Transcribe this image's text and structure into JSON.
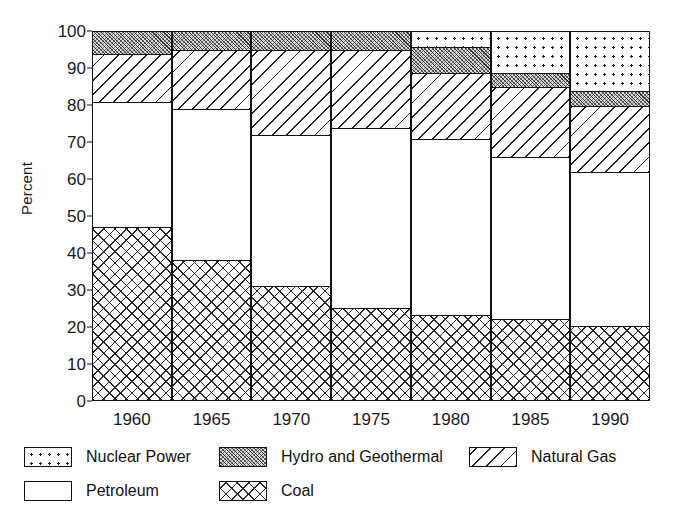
{
  "chart_data": {
    "type": "bar",
    "subtype": "stacked-bar",
    "title": "",
    "xlabel": "",
    "ylabel": "Percent",
    "ylim": [
      0,
      100
    ],
    "yticks": [
      0,
      10,
      20,
      30,
      40,
      50,
      60,
      70,
      80,
      90,
      100
    ],
    "grid": false,
    "legend_position": "below",
    "categories": [
      "1960",
      "1965",
      "1970",
      "1975",
      "1980",
      "1985",
      "1990"
    ],
    "series": [
      {
        "name": "Coal",
        "pattern": "crosshatch",
        "values": [
          47,
          38,
          31,
          25,
          23,
          22,
          20
        ]
      },
      {
        "name": "Petroleum",
        "pattern": "solid-white",
        "values": [
          34,
          41,
          41,
          49,
          48,
          44,
          42
        ]
      },
      {
        "name": "Natural Gas",
        "pattern": "diagonal-hatch",
        "values": [
          13,
          16,
          23,
          21,
          18,
          19,
          18
        ]
      },
      {
        "name": "Hydro and Geothermal",
        "pattern": "fine-stipple",
        "values": [
          6,
          5,
          5,
          5,
          7,
          4,
          4
        ]
      },
      {
        "name": "Nuclear Power",
        "pattern": "dotted",
        "values": [
          0,
          0,
          0,
          0,
          4,
          11,
          16
        ]
      }
    ],
    "stack_tops": {
      "1960": {
        "coal": 47,
        "petroleum": 81,
        "natural_gas": 94,
        "hydro": 100,
        "nuclear": 100
      },
      "1965": {
        "coal": 38,
        "petroleum": 79,
        "natural_gas": 95,
        "hydro": 100,
        "nuclear": 100
      },
      "1970": {
        "coal": 31,
        "petroleum": 72,
        "natural_gas": 95,
        "hydro": 100,
        "nuclear": 100
      },
      "1975": {
        "coal": 25,
        "petroleum": 74,
        "natural_gas": 95,
        "hydro": 100,
        "nuclear": 100
      },
      "1980": {
        "coal": 23,
        "petroleum": 71,
        "natural_gas": 89,
        "hydro": 96,
        "nuclear": 100
      },
      "1985": {
        "coal": 22,
        "petroleum": 66,
        "natural_gas": 85,
        "hydro": 89,
        "nuclear": 100
      },
      "1990": {
        "coal": 20,
        "petroleum": 62,
        "natural_gas": 80,
        "hydro": 84,
        "nuclear": 100
      }
    }
  },
  "axis": {
    "y_title": "Percent",
    "y_tick_labels": [
      "100",
      "90",
      "80",
      "70",
      "60",
      "50",
      "40",
      "30",
      "20",
      "10",
      "0"
    ],
    "x_tick_labels": [
      "1960",
      "1965",
      "1970",
      "1975",
      "1980",
      "1985",
      "1990"
    ]
  },
  "legend": {
    "row1": [
      {
        "label": "Nuclear Power",
        "pattern": "dotted"
      },
      {
        "label": "Hydro and Geothermal",
        "pattern": "fine-stipple"
      },
      {
        "label": "Natural Gas",
        "pattern": "diagonal-hatch"
      }
    ],
    "row2": [
      {
        "label": "Petroleum",
        "pattern": "solid-white"
      },
      {
        "label": "Coal",
        "pattern": "crosshatch"
      }
    ]
  },
  "colors": {
    "ink": "#111111",
    "background": "#ffffff",
    "hydro_fill": "#d9d9d9"
  }
}
